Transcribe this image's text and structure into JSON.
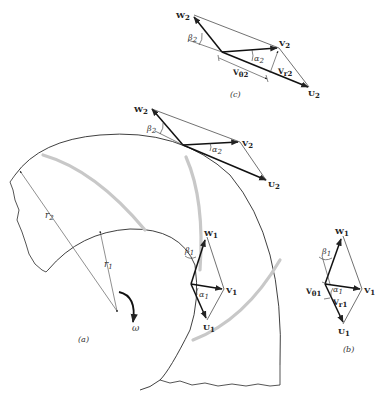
{
  "figure": {
    "type": "centrifugal pump impeller velocity diagrams",
    "panels": [
      {
        "id": "a",
        "label": "(a)",
        "content": "impeller with blades, inlet and outlet velocity triangles"
      },
      {
        "id": "b",
        "label": "(b)",
        "content": "inlet velocity triangle"
      },
      {
        "id": "c",
        "label": "(c)",
        "content": "outlet velocity triangle"
      }
    ]
  },
  "labels": {
    "panel_a": "(a)",
    "panel_b": "(b)",
    "panel_c": "(c)",
    "omega": "ω",
    "r1": "r",
    "r1_sub": "1",
    "r2": "r",
    "r2_sub": "2",
    "W": "W",
    "V": "V",
    "U": "U",
    "beta": "β",
    "alpha": "α",
    "Vr": "V",
    "Vr_sub_r": "r",
    "Vtheta": "V",
    "Vtheta_sub": "θ",
    "sub1": "1",
    "sub2": "2"
  },
  "vectors": {
    "inlet": [
      "W1",
      "V1",
      "U1"
    ],
    "outlet": [
      "W2",
      "V2",
      "U2"
    ],
    "inlet_components": [
      "Vθ1",
      "Vr1"
    ],
    "outlet_components": [
      "Vθ2",
      "Vr2"
    ],
    "angles": [
      "α1",
      "β1",
      "α2",
      "β2"
    ]
  },
  "colors": {
    "line": "#2a2a2a",
    "blade": "#c8c8c8",
    "background": "#ffffff"
  }
}
